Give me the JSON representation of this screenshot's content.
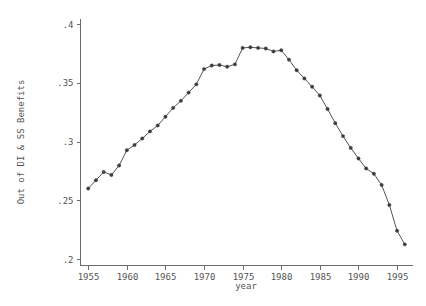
{
  "chart_data": {
    "type": "line",
    "title": "",
    "xlabel": "year",
    "ylabel": "Out of DI & SS Benefits",
    "xlim": [
      1954.0,
      1997.0
    ],
    "ylim": [
      0.195,
      0.405
    ],
    "grid": false,
    "legend": "none",
    "marker": "filled-circle",
    "x": [
      1955,
      1956,
      1957,
      1958,
      1959,
      1960,
      1961,
      1962,
      1963,
      1964,
      1965,
      1966,
      1967,
      1968,
      1969,
      1970,
      1971,
      1972,
      1973,
      1974,
      1975,
      1976,
      1977,
      1978,
      1979,
      1980,
      1981,
      1982,
      1983,
      1984,
      1985,
      1986,
      1987,
      1988,
      1989,
      1990,
      1991,
      1992,
      1993,
      1994,
      1995,
      1996
    ],
    "values": [
      0.2605,
      0.2675,
      0.2745,
      0.272,
      0.28,
      0.293,
      0.2975,
      0.303,
      0.309,
      0.314,
      0.3215,
      0.329,
      0.335,
      0.342,
      0.349,
      0.362,
      0.365,
      0.3655,
      0.364,
      0.366,
      0.38,
      0.3805,
      0.38,
      0.3795,
      0.377,
      0.378,
      0.37,
      0.361,
      0.354,
      0.347,
      0.3395,
      0.328,
      0.316,
      0.305,
      0.295,
      0.286,
      0.2775,
      0.273,
      0.2635,
      0.2465,
      0.2245,
      0.213
    ],
    "x_ticks": [
      1955,
      1960,
      1965,
      1970,
      1975,
      1980,
      1985,
      1990,
      1995
    ],
    "x_tick_labels": [
      "1955",
      "1960",
      "1965",
      "1970",
      "1975",
      "1980",
      "1985",
      "1990",
      "1995"
    ],
    "y_ticks": [
      0.2,
      0.25,
      0.3,
      0.35,
      0.4
    ],
    "y_tick_labels": [
      ".2",
      ".25",
      ".3",
      ".35",
      ".4"
    ],
    "colors": {
      "line": "#555555",
      "marker": "#3c3c3c",
      "axis": "#6b6b6b",
      "text": "#555555",
      "background": "#ffffff"
    }
  }
}
